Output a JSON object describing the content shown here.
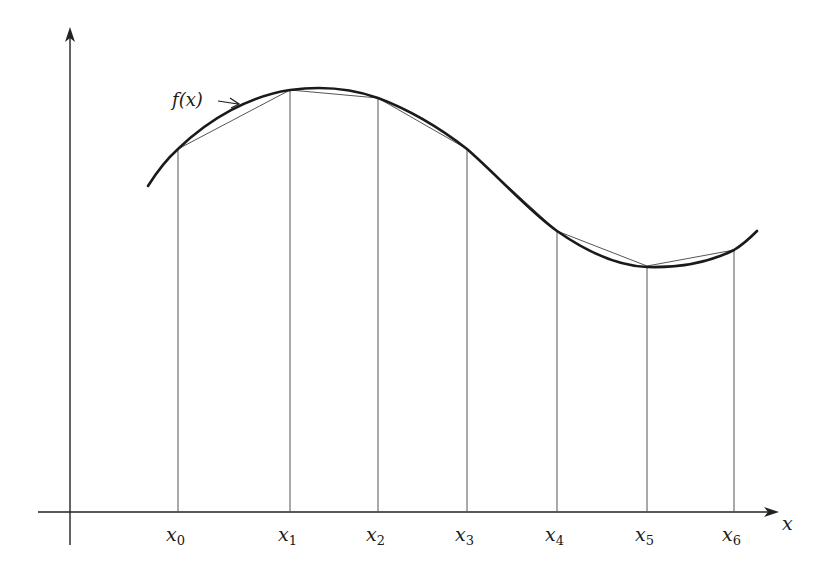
{
  "diagram": {
    "function_label": "f(x)",
    "axis_label_x": "x",
    "colors": {
      "curve": "#1a1a1a",
      "chord": "#555555",
      "ordinate": "#555555",
      "axis": "#222222"
    },
    "points": [
      {
        "label": "x",
        "sub": "0",
        "px": 178,
        "py": 149
      },
      {
        "label": "x",
        "sub": "1",
        "px": 290,
        "py": 90
      },
      {
        "label": "x",
        "sub": "2",
        "px": 378,
        "py": 98
      },
      {
        "label": "x",
        "sub": "3",
        "px": 467,
        "py": 149
      },
      {
        "label": "x",
        "sub": "4",
        "px": 557,
        "py": 231
      },
      {
        "label": "x",
        "sub": "5",
        "px": 647,
        "py": 266
      },
      {
        "label": "x",
        "sub": "6",
        "px": 734,
        "py": 250
      }
    ],
    "axes": {
      "origin_px": 70,
      "baseline_py": 512,
      "y_top_py": 28,
      "x_end_px": 778
    }
  }
}
